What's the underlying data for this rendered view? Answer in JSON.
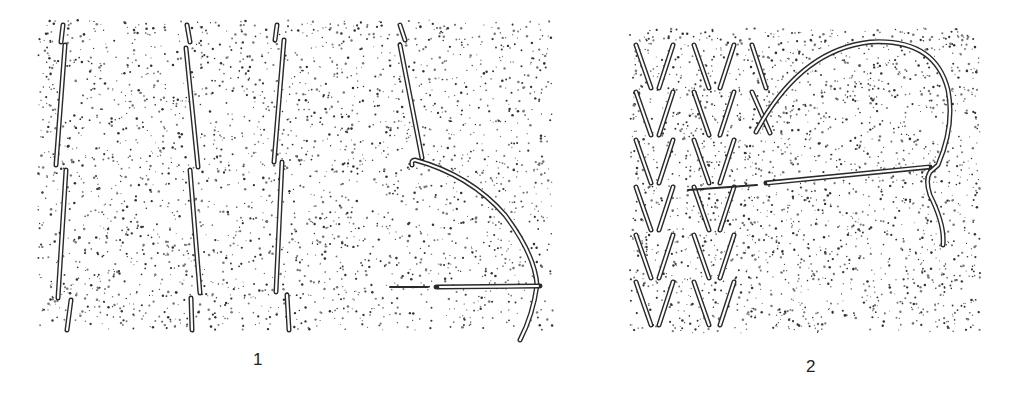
{
  "figure": {
    "panels": [
      {
        "id": "panel-1",
        "caption": "1"
      },
      {
        "id": "panel-2",
        "caption": "2"
      }
    ]
  },
  "colors": {
    "ink": "#2a2a2a",
    "background": "#ffffff"
  }
}
